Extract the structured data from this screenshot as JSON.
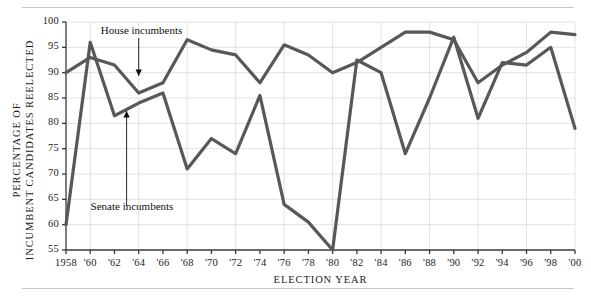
{
  "figure": {
    "axis_title_y": "PERCENTAGE OF INCUMBENT CANDIDATES REELECTED",
    "axis_title_x": "ELECTION YEAR",
    "line_color": "#585858",
    "grid_color": "#e2e2e2",
    "axis_color": "#3a3a3a",
    "annotation_house": "House incumbents",
    "annotation_senate": "Senate incumbents"
  },
  "chart_data": {
    "type": "line",
    "title": "",
    "subtitle": "",
    "xlabel": "ELECTION YEAR",
    "ylabel": "PERCENTAGE OF INCUMBENT CANDIDATES REELECTED",
    "xlim": [
      1958,
      2000
    ],
    "ylim": [
      55,
      100
    ],
    "yticks": [
      55,
      60,
      65,
      70,
      75,
      80,
      85,
      90,
      95,
      100
    ],
    "ytick_labels": [
      "55",
      "60",
      "65",
      "70",
      "75",
      "80",
      "85",
      "90",
      "95",
      "100"
    ],
    "grid": true,
    "grid_axis": "both",
    "legend": "inline-annotations",
    "x": [
      1958,
      1960,
      1962,
      1964,
      1966,
      1968,
      1970,
      1972,
      1974,
      1976,
      1978,
      1980,
      1982,
      1984,
      1986,
      1988,
      1990,
      1992,
      1994,
      1996,
      1998,
      2000
    ],
    "xtick_labels": [
      "1958",
      "'60",
      "'62",
      "'64",
      "'66",
      "'68",
      "'70",
      "'72",
      "'74",
      "'76",
      "'78",
      "'80",
      "'82",
      "'84",
      "'86",
      "'88",
      "'90",
      "'92",
      "'94",
      "'96",
      "'98",
      "'00"
    ],
    "series": [
      {
        "name": "House incumbents",
        "values": [
          90,
          93,
          91.5,
          86,
          88,
          96.5,
          94.5,
          93.5,
          88,
          95.5,
          93.5,
          90,
          92,
          95,
          98,
          98,
          96.5,
          88,
          91.5,
          94,
          98,
          97.5
        ]
      },
      {
        "name": "Senate incumbents",
        "values": [
          60,
          96,
          81.5,
          84,
          86,
          71,
          77,
          74,
          85.5,
          64,
          60.5,
          55,
          92.5,
          90,
          74,
          85,
          97,
          81,
          92,
          91.5,
          95,
          79
        ]
      }
    ],
    "annotations": [
      {
        "text": "House incumbents",
        "points_to_series": "House incumbents",
        "points_to_x": 1964
      },
      {
        "text": "Senate incumbents",
        "points_to_series": "Senate incumbents",
        "points_to_x": 1963
      }
    ]
  }
}
